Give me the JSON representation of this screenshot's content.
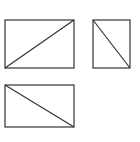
{
  "diagram": {
    "stroke_color": "#333333",
    "background": "#ffffff",
    "shapes": [
      {
        "name": "rect-wide-top",
        "x": 5,
        "y": 20,
        "w": 69,
        "h": 48,
        "diagonal": "bottom-left-to-top-right"
      },
      {
        "name": "rect-narrow-top",
        "x": 93,
        "y": 20,
        "w": 37,
        "h": 48,
        "diagonal": "top-left-to-bottom-right"
      },
      {
        "name": "rect-wide-bottom",
        "x": 5,
        "y": 85,
        "w": 69,
        "h": 42,
        "diagonal": "top-left-to-bottom-right"
      }
    ]
  }
}
